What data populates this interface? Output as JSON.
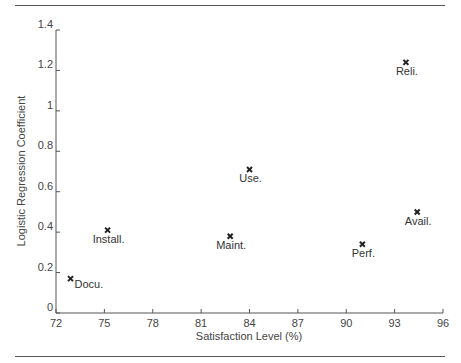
{
  "chart_data": {
    "type": "scatter",
    "title": "",
    "xlabel": "Satisfaction Level (%)",
    "ylabel": "Logistic Regression Coefficient",
    "xlim": [
      72,
      96
    ],
    "ylim": [
      0,
      1.4
    ],
    "x_ticks": [
      72,
      75,
      78,
      81,
      84,
      87,
      90,
      93,
      96
    ],
    "y_ticks": [
      0,
      0.2,
      0.4,
      0.6,
      0.8,
      1,
      1.2,
      1.4
    ],
    "y_tick_labels": [
      "0",
      "0.2",
      "0.4",
      "0.6",
      "0.8",
      "1",
      "1.2",
      "1.4"
    ],
    "grid": false,
    "legend": null,
    "marker": "x",
    "points": [
      {
        "label": "Docu.",
        "x": 72.9,
        "y": 0.17,
        "label_pos": "right"
      },
      {
        "label": "Install.",
        "x": 75.2,
        "y": 0.41,
        "label_pos": "below"
      },
      {
        "label": "Maint.",
        "x": 82.8,
        "y": 0.38,
        "label_pos": "below"
      },
      {
        "label": "Use.",
        "x": 84.0,
        "y": 0.71,
        "label_pos": "below"
      },
      {
        "label": "Perf.",
        "x": 91.0,
        "y": 0.34,
        "label_pos": "below"
      },
      {
        "label": "Avail.",
        "x": 94.4,
        "y": 0.5,
        "label_pos": "below"
      },
      {
        "label": "Reli.",
        "x": 93.7,
        "y": 1.24,
        "label_pos": "below"
      }
    ]
  },
  "colors": {
    "axis": "#555555",
    "marker": "#222222",
    "text": "#333333"
  }
}
